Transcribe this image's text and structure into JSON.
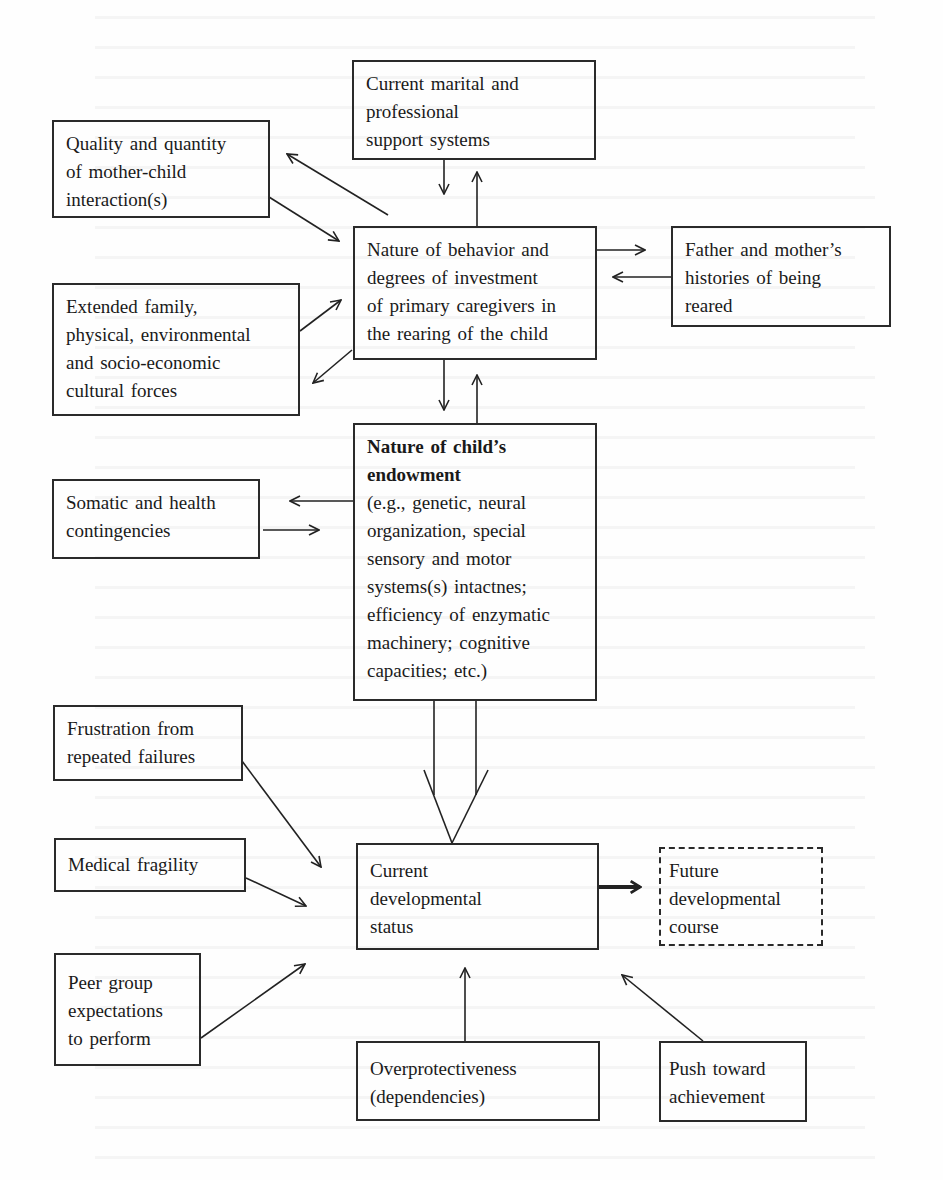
{
  "diagram": {
    "type": "flow-diagram",
    "nodes": {
      "marital": {
        "lines": [
          "Current marital and",
          "professional",
          "support systems"
        ]
      },
      "quality": {
        "lines": [
          "Quality and quantity",
          "of mother-child",
          "interaction(s)"
        ]
      },
      "behavior": {
        "lines": [
          "Nature of behavior and",
          "degrees of investment",
          "of primary caregivers in",
          "the rearing of the child"
        ]
      },
      "father": {
        "lines": [
          "Father and mother’s",
          "histories of being",
          "reared"
        ]
      },
      "extended": {
        "lines": [
          "Extended family,",
          "physical, environmental",
          "and socio-economic",
          "cultural forces"
        ]
      },
      "endowment": {
        "title_lines": [
          "Nature of child’s",
          "endowment"
        ],
        "lines": [
          "(e.g., genetic, neural",
          "organization, special",
          "sensory and motor",
          "systems(s) intactnes;",
          "efficiency of enzymatic",
          "machinery; cognitive",
          "capacities; etc.)"
        ]
      },
      "somatic": {
        "lines": [
          "Somatic and health",
          "contingencies"
        ]
      },
      "frustration": {
        "lines": [
          "Frustration from",
          "repeated failures"
        ]
      },
      "medical": {
        "lines": [
          "Medical fragility"
        ]
      },
      "peer": {
        "lines": [
          "Peer group",
          "expectations",
          "to perform"
        ]
      },
      "current_status": {
        "lines": [
          "Current",
          "developmental",
          "status"
        ]
      },
      "future": {
        "lines": [
          "Future",
          "developmental",
          "course"
        ],
        "style": "dashed"
      },
      "overprotect": {
        "lines": [
          "Overprotectiveness",
          "(dependencies)"
        ]
      },
      "push": {
        "lines": [
          "Push toward",
          "achievement"
        ]
      }
    },
    "edges": [
      {
        "from": "marital",
        "to": "behavior"
      },
      {
        "from": "behavior",
        "to": "marital"
      },
      {
        "from": "quality",
        "to": "behavior"
      },
      {
        "from": "behavior",
        "to": "quality"
      },
      {
        "from": "behavior",
        "to": "father"
      },
      {
        "from": "father",
        "to": "behavior"
      },
      {
        "from": "extended",
        "to": "behavior"
      },
      {
        "from": "behavior",
        "to": "extended"
      },
      {
        "from": "behavior",
        "to": "endowment"
      },
      {
        "from": "endowment",
        "to": "behavior"
      },
      {
        "from": "endowment",
        "to": "somatic"
      },
      {
        "from": "somatic",
        "to": "endowment"
      },
      {
        "from": "endowment",
        "to": "current_status",
        "style": "wide"
      },
      {
        "from": "frustration",
        "to": "current_status"
      },
      {
        "from": "medical",
        "to": "current_status"
      },
      {
        "from": "peer",
        "to": "current_status"
      },
      {
        "from": "overprotect",
        "to": "current_status"
      },
      {
        "from": "push",
        "to": "current_status"
      },
      {
        "from": "current_status",
        "to": "future",
        "style": "bold"
      }
    ]
  }
}
